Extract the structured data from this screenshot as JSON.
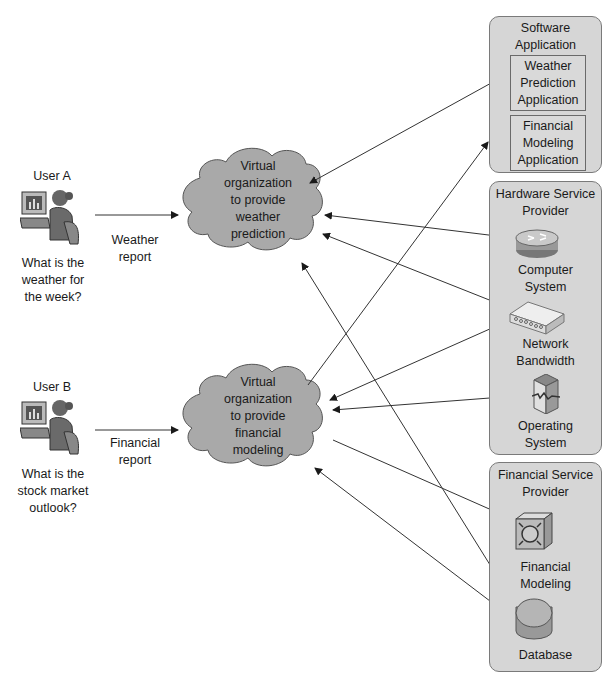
{
  "users": [
    {
      "label": "User A",
      "question": "What is the\nweather for\nthe week?",
      "request_label": "Weather\nreport"
    },
    {
      "label": "User B",
      "question": "What is the\nstock market\noutlook?",
      "request_label": "Financial\nreport"
    }
  ],
  "virtual_orgs": [
    {
      "label": "Virtual\norganization\nto provide\nweather\nprediction"
    },
    {
      "label": "Virtual\norganization\nto provide\nfinancial\nmodeling"
    }
  ],
  "providers": {
    "software": {
      "title": "Software Application\nProvider",
      "apps": [
        {
          "label": "Weather\nPrediction\nApplication"
        },
        {
          "label": "Financial\nModeling\nApplication"
        }
      ]
    },
    "hardware": {
      "title": "Hardware Service\nProvider",
      "resources": [
        {
          "label": "Computer\nSystem",
          "icon": "router-icon"
        },
        {
          "label": "Network\nBandwidth",
          "icon": "switch-icon"
        },
        {
          "label": "Operating\nSystem",
          "icon": "server-icon"
        }
      ]
    },
    "financial": {
      "title": "Financial Service\nProvider",
      "resources": [
        {
          "label": "Financial\nModeling",
          "icon": "processor-icon"
        },
        {
          "label": "Database",
          "icon": "database-icon"
        }
      ]
    }
  },
  "colors": {
    "provider_fill": "#d6d6d6",
    "cloud_fill": "#a9a9a9",
    "line": "#333333"
  }
}
